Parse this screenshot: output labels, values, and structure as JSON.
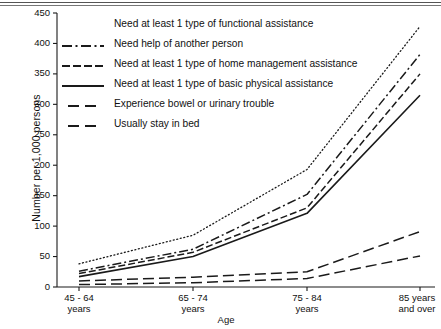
{
  "chart_data": {
    "type": "line",
    "title": "",
    "subtitle": "",
    "xlabel": "Age",
    "ylabel": "Number per 1,000 persons",
    "categories": [
      "45 - 64 years",
      "65 - 74 years",
      "75 - 84 years",
      "85 years and over"
    ],
    "category_lines": [
      [
        "45 - 64",
        "years"
      ],
      [
        "65 - 74",
        "years"
      ],
      [
        "75 - 84",
        "years"
      ],
      [
        "85 years",
        "and over"
      ]
    ],
    "ylim": [
      0,
      450
    ],
    "yticks": [
      0,
      50,
      100,
      150,
      200,
      250,
      300,
      350,
      400,
      450
    ],
    "ytick_labels": [
      "0",
      "50",
      "100",
      "150",
      "200",
      "250",
      "300",
      "350",
      "400",
      "450"
    ],
    "grid": false,
    "legend_position": "upper-left-inside",
    "series": [
      {
        "name": "Need at least 1 type of functional assistance",
        "style": "dotted",
        "dasharray": "1,2.6",
        "width": 1.3,
        "values": [
          38,
          85,
          193,
          428
        ]
      },
      {
        "name": "Need help of another person",
        "style": "dash-dot",
        "dasharray": "9,3,2,3",
        "width": 1.5,
        "values": [
          26,
          62,
          152,
          382
        ]
      },
      {
        "name": "Need at least 1 type of home management assistance",
        "style": "dashed-short",
        "dasharray": "7,3",
        "width": 1.5,
        "values": [
          22,
          57,
          130,
          350
        ]
      },
      {
        "name": "Need at least 1 type of basic physical assistance",
        "style": "solid",
        "dasharray": "",
        "width": 1.6,
        "values": [
          17,
          50,
          121,
          315
        ]
      },
      {
        "name": "Experience bowel or urinary trouble",
        "style": "dashed-long",
        "dasharray": "11,5",
        "width": 1.5,
        "values": [
          10,
          16,
          25,
          91
        ]
      },
      {
        "name": "Usually stay in bed",
        "style": "dashed-long",
        "dasharray": "11,5",
        "width": 1.5,
        "values": [
          4,
          7,
          14,
          51
        ]
      }
    ],
    "colors": {
      "line": "#1a1a1a",
      "axis": "#1a1a1a",
      "text": "#111111",
      "background": "#ffffff"
    }
  },
  "legend": {
    "items": [
      {
        "label": "Need at least 1 type of functional assistance",
        "sample": "dotted"
      },
      {
        "label": "Need help of another person",
        "sample": "dash-dot"
      },
      {
        "label": "Need at least 1 type of home management assistance",
        "sample": "dashed-short"
      },
      {
        "label": "Need at least 1 type of basic physical assistance",
        "sample": "solid"
      },
      {
        "label": "Experience bowel or urinary trouble",
        "sample": "dashed-long"
      },
      {
        "label": "Usually stay in bed",
        "sample": "dashed-long"
      }
    ]
  }
}
